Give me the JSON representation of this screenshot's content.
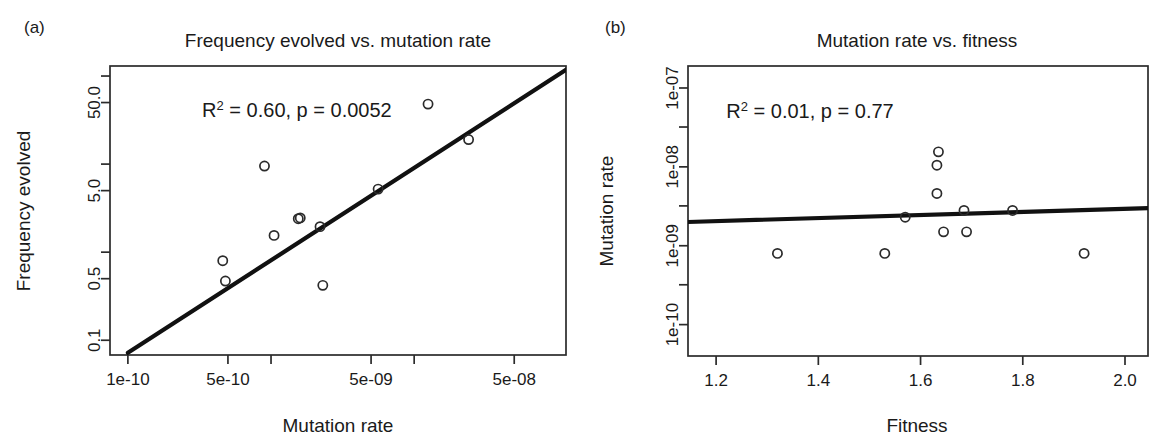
{
  "figure": {
    "width": 1175,
    "height": 447,
    "background": "#ffffff",
    "ink_color": "#2b2b2b"
  },
  "panels": [
    {
      "tag": "(a)",
      "title": "Frequency evolved vs. mutation rate",
      "xlabel": "Mutation rate",
      "ylabel": "Frequency evolved",
      "annotation": "R² = 0.60, p = 0.0052",
      "annotation_parts": {
        "base": "R",
        "sup": "2",
        "rest": " = 0.60, p = 0.0052"
      }
    },
    {
      "tag": "(b)",
      "title": "Mutation rate vs. fitness",
      "xlabel": "Fitness",
      "ylabel": "Mutation rate",
      "annotation": "R² = 0.01, p = 0.77",
      "annotation_parts": {
        "base": "R",
        "sup": "2",
        "rest": " = 0.01, p = 0.77"
      }
    }
  ],
  "chart_data": [
    {
      "panel": "a",
      "type": "scatter",
      "title": "Frequency evolved vs. mutation rate",
      "xlabel": "Mutation rate",
      "ylabel": "Frequency evolved",
      "xscale": "log",
      "yscale": "log",
      "xlim": [
        7.5e-11,
        1.15e-07
      ],
      "ylim": [
        0.068,
        130
      ],
      "grid": false,
      "legend": null,
      "xticks": [
        1e-10,
        5e-10,
        1e-09,
        5e-09,
        1e-08,
        5e-08
      ],
      "xtick_labels": [
        "1e-10",
        "5e-10",
        "",
        "5e-09",
        "",
        "5e-08"
      ],
      "yticks": [
        0.1,
        0.5,
        1,
        5,
        10,
        50,
        100
      ],
      "ytick_labels": [
        "0.1",
        "0.5",
        "",
        "5.0",
        "",
        "50.0",
        ""
      ],
      "annotations": [
        {
          "text": "R² = 0.60, p = 0.0052",
          "x": 3.3e-10,
          "y": 34
        }
      ],
      "points": [
        {
          "x": 4.6e-10,
          "y": 0.8
        },
        {
          "x": 4.8e-10,
          "y": 0.47
        },
        {
          "x": 1.05e-09,
          "y": 1.55
        },
        {
          "x": 1.55e-09,
          "y": 2.4
        },
        {
          "x": 1.6e-09,
          "y": 2.45
        },
        {
          "x": 9e-10,
          "y": 9.5
        },
        {
          "x": 2.2e-09,
          "y": 1.95
        },
        {
          "x": 2.3e-09,
          "y": 0.42
        },
        {
          "x": 5.6e-09,
          "y": 5.2
        },
        {
          "x": 1.25e-08,
          "y": 48.0
        },
        {
          "x": 2.4e-08,
          "y": 19.0
        }
      ],
      "fit_line": {
        "type": "linear-in-log-log",
        "x_start": 1e-10,
        "y_start": 0.072,
        "x_end": 1.15e-07,
        "y_end": 118.0
      },
      "r_squared": 0.6,
      "p_value": 0.0052
    },
    {
      "panel": "b",
      "type": "scatter",
      "title": "Mutation rate vs. fitness",
      "xlabel": "Fitness",
      "ylabel": "Mutation rate",
      "xscale": "linear",
      "yscale": "log",
      "xlim": [
        1.145,
        2.045
      ],
      "ylim": [
        4e-11,
        1.9e-07
      ],
      "grid": false,
      "legend": null,
      "xticks": [
        1.2,
        1.4,
        1.6,
        1.8,
        2.0
      ],
      "xtick_labels": [
        "1.2",
        "1.4",
        "1.6",
        "1.8",
        "2.0"
      ],
      "yticks": [
        1e-10,
        1e-09,
        1e-08,
        1e-07
      ],
      "ytick_labels": [
        "1e-10",
        "1e-09",
        "1e-08",
        "1e-07"
      ],
      "yticks_minor": [
        3.2e-10,
        3.2e-09,
        3.2e-08
      ],
      "annotations": [
        {
          "text": "R² = 0.01, p = 0.77",
          "x": 1.22,
          "y": 4.2e-08
        }
      ],
      "points": [
        {
          "x": 1.32,
          "y": 8e-10
        },
        {
          "x": 1.53,
          "y": 8e-10
        },
        {
          "x": 1.57,
          "y": 2.3e-09
        },
        {
          "x": 1.635,
          "y": 1.55e-08
        },
        {
          "x": 1.632,
          "y": 1.05e-08
        },
        {
          "x": 1.632,
          "y": 4.6e-09
        },
        {
          "x": 1.645,
          "y": 1.5e-09
        },
        {
          "x": 1.685,
          "y": 2.8e-09
        },
        {
          "x": 1.69,
          "y": 1.5e-09
        },
        {
          "x": 1.78,
          "y": 2.8e-09
        },
        {
          "x": 1.92,
          "y": 8e-10
        }
      ],
      "fit_line": {
        "type": "linear-in-x-log-y",
        "x_start": 1.145,
        "y_start": 2e-09,
        "x_end": 2.045,
        "y_end": 3e-09
      },
      "r_squared": 0.01,
      "p_value": 0.77
    }
  ]
}
